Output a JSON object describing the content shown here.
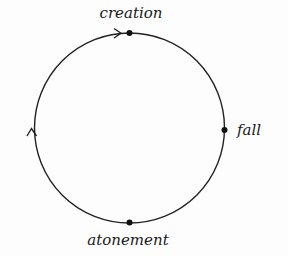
{
  "diagram": {
    "type": "cycle",
    "direction": "clockwise",
    "stroke_color": "#222222",
    "background_color": "#fdfdfd",
    "nodes": [
      {
        "id": "creation",
        "label": "creation",
        "position": "top"
      },
      {
        "id": "fall",
        "label": "fall",
        "position": "right"
      },
      {
        "id": "atonement",
        "label": "atonement",
        "position": "bottom"
      }
    ],
    "arrows": [
      {
        "position": "top-left-of-creation",
        "pointing": "right"
      },
      {
        "position": "left",
        "pointing": "up"
      }
    ]
  }
}
